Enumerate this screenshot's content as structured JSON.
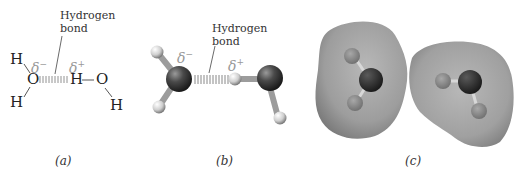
{
  "figure": {
    "panels": [
      {
        "id": "a",
        "caption": "(a)",
        "style": "structural-formula",
        "annotation": "Hydrogen bond",
        "annotation_line1": "Hydrogen",
        "annotation_line2": "bond",
        "partial_charge_negative": "δ",
        "partial_charge_negative_sign": "−",
        "partial_charge_positive": "δ",
        "partial_charge_positive_sign": "+",
        "atoms": {
          "h_top_left": "H",
          "o_left": "O",
          "h_bottom_left": "H",
          "h_middle": "H",
          "o_right": "O",
          "h_bottom_right": "H"
        }
      },
      {
        "id": "b",
        "caption": "(b)",
        "style": "ball-and-stick",
        "annotation_line1": "Hydrogen",
        "annotation_line2": "bond",
        "partial_charge_negative": "δ",
        "partial_charge_negative_sign": "−",
        "partial_charge_positive": "δ",
        "partial_charge_positive_sign": "+"
      },
      {
        "id": "c",
        "caption": "(c)",
        "style": "space-filling surface"
      }
    ],
    "colors": {
      "oxygen": "#3a3a3a",
      "hydrogen": "#d0d0d0",
      "surface": "#a8a8a8",
      "delta_text": "#999999"
    }
  }
}
